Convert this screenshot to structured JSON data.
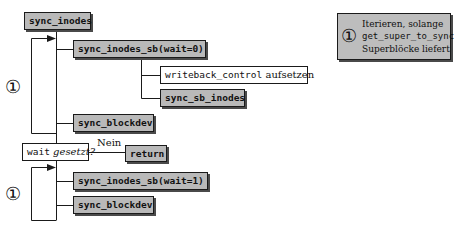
{
  "diagram": {
    "root": {
      "label": "sync_inodes"
    },
    "loop1": {
      "marker": "①",
      "steps": [
        {
          "label": "sync_inodes_sb(wait=0)"
        },
        {
          "label": "sync_blockdev"
        }
      ],
      "substeps": [
        {
          "code": "writeback_control",
          "text": " aufsetzen"
        },
        {
          "label": "sync_sb_inodes"
        }
      ]
    },
    "decision": {
      "code": "wait",
      "text": " gesetzt?",
      "branch_label": "Nein",
      "branch_target": "return"
    },
    "loop2": {
      "marker": "①",
      "steps": [
        {
          "label": "sync_inodes_sb(wait=1)"
        },
        {
          "label": "sync_blockdev"
        }
      ]
    },
    "legend": {
      "marker": "①",
      "line1": "Iterieren, solange",
      "line2": "get_super_to_sync",
      "line3": "Superblöcke liefert"
    },
    "colors": {
      "box_fill": "#b9b9b9",
      "line": "#1a1a1a",
      "shadow": "#4a4a4a"
    }
  }
}
